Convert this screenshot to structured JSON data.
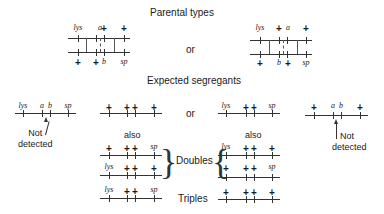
{
  "titles": {
    "parental": "Parental types",
    "or_top": "or",
    "expected": "Expected segregants",
    "or_mid": "or",
    "also_left": "also",
    "also_right": "also",
    "doubles": "Doubles",
    "triples": "Triples",
    "not_detected_left": [
      "Not",
      "detected"
    ],
    "not_detected_right": [
      "Not",
      "detected"
    ]
  },
  "parental_left": {
    "top": [
      "lys",
      "a",
      "+",
      "+"
    ],
    "bottom": [
      "+",
      "+",
      "b",
      "sp"
    ]
  },
  "parental_right": {
    "top": [
      "lys",
      "+",
      "a",
      "+"
    ],
    "bottom": [
      "+",
      "b",
      "+",
      "sp"
    ]
  },
  "segregants": {
    "row1": [
      [
        "lys",
        "a",
        "b",
        "sp"
      ],
      [
        "+",
        "+",
        "+",
        "+"
      ],
      [
        "lys",
        "+",
        "+",
        "sp"
      ],
      [
        "+",
        "a",
        "b",
        "+"
      ]
    ],
    "doubles_left": [
      [
        "+",
        "+",
        "+",
        "sp"
      ],
      [
        "lys",
        "+",
        "+",
        "+"
      ]
    ],
    "doubles_right": [
      [
        "lys",
        "+",
        "+",
        "+"
      ],
      [
        "+",
        "+",
        "+",
        "sp"
      ]
    ],
    "triples": [
      [
        "lys",
        "+",
        "+",
        "sp"
      ],
      [
        "+",
        "+",
        "+",
        "+"
      ]
    ]
  }
}
